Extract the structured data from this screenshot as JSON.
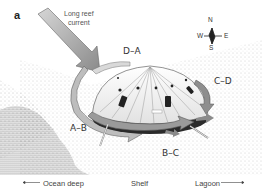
{
  "figure": {
    "panel_letter": "a",
    "current_label_line1": "Long reef",
    "current_label_line2": "current",
    "segments": {
      "da": "D–A",
      "cd": "C–D",
      "ab": "A–B",
      "bc": "B–C"
    },
    "compass": {
      "n": "N",
      "s": "S",
      "e": "E",
      "w": "W"
    },
    "axis": {
      "left": "Ocean deep",
      "center": "Shelf",
      "right": "Lagoon"
    },
    "colors": {
      "arrow_fill": "#9a9a9a",
      "arrow_dark": "#6e6e6e",
      "deep_water": "#5a5a5a",
      "dome": "#f4f4f4",
      "dome_lines": "#888888"
    }
  }
}
